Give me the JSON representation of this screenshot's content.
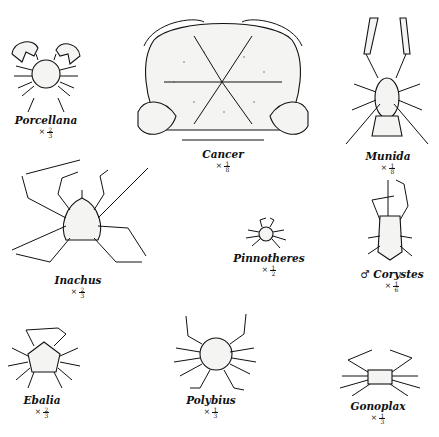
{
  "plate": {
    "specimens": [
      {
        "id": "porcellana",
        "name": "Porcellana",
        "prefix": "",
        "scale_symbol": "×",
        "scale_num": "2",
        "scale_den": "3"
      },
      {
        "id": "cancer",
        "name": "Cancer",
        "prefix": "",
        "scale_symbol": "×",
        "scale_num": "1",
        "scale_den": "8"
      },
      {
        "id": "munida",
        "name": "Munida",
        "prefix": "",
        "scale_symbol": "×",
        "scale_num": "1",
        "scale_den": "8"
      },
      {
        "id": "inachus",
        "name": "Inachus",
        "prefix": "",
        "scale_symbol": "×",
        "scale_num": "2",
        "scale_den": "3"
      },
      {
        "id": "pinnotheres",
        "name": "Pinnotheres",
        "prefix": "",
        "scale_symbol": "×",
        "scale_num": "1",
        "scale_den": "2"
      },
      {
        "id": "corystes",
        "name": "Corystes",
        "prefix": "♂",
        "scale_symbol": "×",
        "scale_num": "1",
        "scale_den": "6"
      },
      {
        "id": "ebalia",
        "name": "Ebalia",
        "prefix": "",
        "scale_symbol": "×",
        "scale_num": "2",
        "scale_den": "3"
      },
      {
        "id": "polybius",
        "name": "Polybius",
        "prefix": "",
        "scale_symbol": "×",
        "scale_num": "1",
        "scale_den": "3"
      },
      {
        "id": "gonoplax",
        "name": "Gonoplax",
        "prefix": "",
        "scale_symbol": "×",
        "scale_num": "1",
        "scale_den": "3"
      }
    ]
  }
}
